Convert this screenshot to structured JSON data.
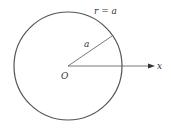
{
  "diagram": {
    "type": "polar-circle",
    "circle": {
      "equation_label": "r = a",
      "cx": 68,
      "cy": 66,
      "r": 54
    },
    "radius_label": "a",
    "origin_label": "O",
    "axis_label": "x",
    "colors": {
      "stroke": "#555555",
      "text": "#333333",
      "background": "#ffffff"
    }
  }
}
